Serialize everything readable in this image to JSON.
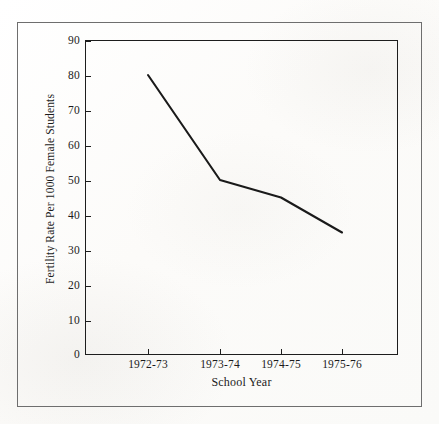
{
  "figure": {
    "background_color": "#fdfdfc",
    "ink_color": "#1b1b1b",
    "outer_border_color": "#6e6e6e"
  },
  "chart_data": {
    "type": "line",
    "title": "",
    "subtitle": "",
    "xlabel": "School Year",
    "ylabel": "Fertility Rate Per 1000 Female Students",
    "categories": [
      "1972-73",
      "1973-74",
      "1974-75",
      "1975-76"
    ],
    "values": [
      80,
      50,
      45,
      35
    ],
    "series": [
      {
        "name": "Fertility Rate Per 1000 Female Students",
        "values": [
          80,
          50,
          45,
          35
        ],
        "color": "#1a1a1a",
        "line_width": 2.1,
        "markers": false
      }
    ],
    "ylim": [
      0,
      90
    ],
    "ytick_values": [
      0,
      10,
      20,
      30,
      40,
      50,
      60,
      70,
      80,
      90
    ],
    "ytick_labels": [
      "0",
      "10",
      "20",
      "30",
      "40",
      "50",
      "60",
      "70",
      "80",
      "90"
    ],
    "xtick_labels": [
      "1972-73",
      "1973-74",
      "1974-75",
      "1975-76"
    ],
    "grid": false,
    "legend": false,
    "legend_position": "none",
    "annotations": [],
    "frame": "full-box",
    "tick_direction": "out"
  },
  "axes": {
    "y_title": "Fertility Rate Per 1000 Female Students",
    "x_title": "School Year",
    "y_ticks": [
      "90",
      "80",
      "70",
      "60",
      "50",
      "40",
      "30",
      "20",
      "10",
      "0"
    ],
    "x_ticks": [
      "1972-73",
      "1973-74",
      "1974-75",
      "1975-76"
    ]
  }
}
